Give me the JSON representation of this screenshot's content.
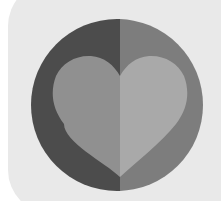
{
  "canvas": {
    "width": 221,
    "height": 201,
    "background_color": "#ffffff",
    "title": "Heart Logo Mark"
  },
  "plate": {
    "name": "rounded-square-plate",
    "color": "#e9e9e9",
    "x": 8,
    "y": -18,
    "width": 232,
    "height": 232,
    "corner_radius": 44
  },
  "circle": {
    "name": "split-circle",
    "center_x": 117,
    "center_y": 105,
    "radius": 86,
    "left_half_color": "#4c4c4c",
    "right_half_color": "#7d7d7d",
    "split_x": 120
  },
  "heart": {
    "name": "split-heart",
    "left_half_color": "#909090",
    "right_half_color": "#a9a9a9",
    "split_x": 120,
    "left_extent": 52,
    "right_extent": 190,
    "top_extent": 55,
    "bottom_point": 177
  },
  "labels": {
    "alt_text": "Grayscale heart inside a circle on a rounded square"
  }
}
